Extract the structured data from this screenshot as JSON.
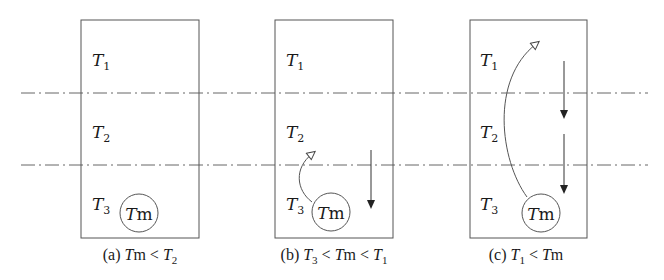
{
  "diagram": {
    "zones": [
      {
        "label": "T",
        "sub": "1"
      },
      {
        "label": "T",
        "sub": "2"
      },
      {
        "label": "T",
        "sub": "3"
      }
    ],
    "circle_label": {
      "main": "T",
      "rest": "m"
    },
    "panels": [
      {
        "id": "a",
        "caption": {
          "prefix": "(a) ",
          "parts": [
            {
              "t": "T",
              "i": true
            },
            {
              "t": "m",
              "i": false
            },
            {
              "t": "<",
              "i": false
            },
            {
              "t": "T",
              "i": true
            }
          ],
          "sub": "2"
        },
        "caption_text": "(a) Tm < T2",
        "rising_arrow": "none",
        "sinking_arrows": 0
      },
      {
        "id": "b",
        "caption_text": "(b) T3 < Tm < T1",
        "rising_arrow": "curved, from Tm up to T2 zone (open triangle head)",
        "sinking_arrows": 1
      },
      {
        "id": "c",
        "caption_text": "(c) T1 < Tm",
        "rising_arrow": "curved, from Tm up to T1 zone (open triangle head)",
        "sinking_arrows": 2
      }
    ],
    "colors": {
      "line": "#555555",
      "text": "#1a1a1a",
      "background": "#ffffff"
    }
  }
}
